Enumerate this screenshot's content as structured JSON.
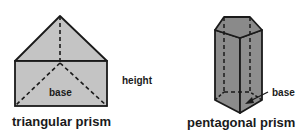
{
  "figures": [
    {
      "id": "triangular",
      "title": "triangular prism",
      "labels": {
        "base": "base",
        "height": "height"
      },
      "fill": "#c4c4c4"
    },
    {
      "id": "pentagonal",
      "title": "pentagonal prism",
      "labels": {
        "base": "base"
      },
      "fill": "#8c8c8c",
      "top_fill": "#8a8a8a"
    }
  ],
  "colors": {
    "edge": "#1a1a1a",
    "background": "#ffffff"
  }
}
